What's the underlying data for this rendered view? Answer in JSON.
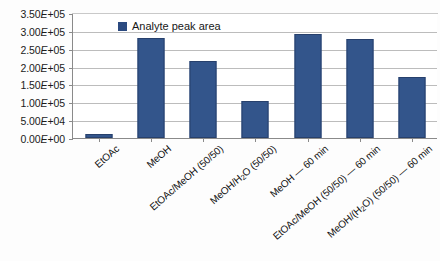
{
  "chart_data": {
    "type": "bar",
    "title": "",
    "subtitle": "",
    "xlabel": "",
    "ylabel": "",
    "categories": [
      "EtOAc",
      "MeOH",
      "EtOAc/MeOH (50/50)",
      "MeOH/H₂O (50/50)",
      "MeOH — 60 min",
      "EtOAc/MeOH (50/50) — 60 min",
      "MeOH/(H₂O) (50/50) — 60 min"
    ],
    "series": [
      {
        "name": "Analyte peak area",
        "values": [
          10000,
          280000,
          215000,
          105000,
          292000,
          278000,
          170000
        ],
        "color": "#33558b"
      }
    ],
    "ylim": [
      0,
      350000
    ],
    "ytick_values": [
      0,
      50000,
      100000,
      150000,
      200000,
      250000,
      300000,
      350000
    ],
    "ytick_labels": [
      "0.00E+00",
      "5.00E+04",
      "1.00E+05",
      "1.50E+05",
      "2.00E+05",
      "2.50E+05",
      "3.00E+05",
      "3.50E+05"
    ],
    "grid": true,
    "grid_axis": "y",
    "legend": {
      "position": "inside-top-left",
      "entries": [
        "Analyte peak area"
      ]
    }
  },
  "legend": {
    "label": "Analyte peak area"
  }
}
